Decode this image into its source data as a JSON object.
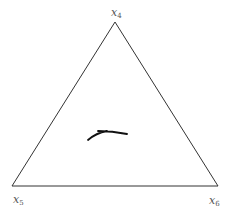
{
  "diagram": {
    "type": "ternary-simplex",
    "stroke_color": "#333333",
    "curve_color": "#111111",
    "vertices": [
      {
        "id": "top",
        "label_base": "x",
        "label_sub": "4",
        "x": 115,
        "y": 22
      },
      {
        "id": "bottom-left",
        "label_base": "x",
        "label_sub": "5",
        "x": 12,
        "y": 186
      },
      {
        "id": "bottom-right",
        "label_base": "x",
        "label_sub": "6",
        "x": 218,
        "y": 186
      }
    ],
    "curve": {
      "description": "small trajectory stroke near triangle center",
      "path": "M 88 140 Q 96 133 107 131 M 98 131 Q 112 131 127 134"
    }
  }
}
